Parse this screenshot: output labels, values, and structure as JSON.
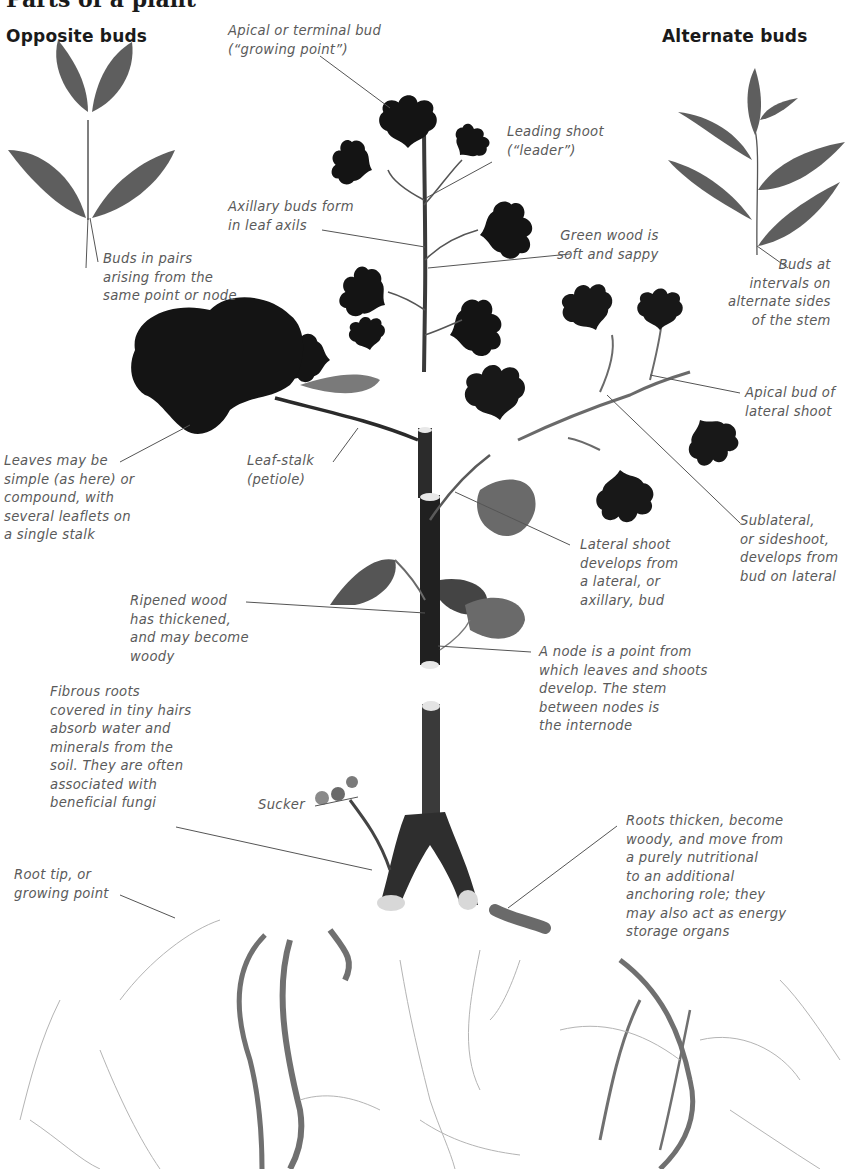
{
  "title": "Parts of a plant",
  "headings": {
    "opposite": "Opposite buds",
    "alternate": "Alternate buds"
  },
  "labels": {
    "apical_bud": "Apical or terminal bud\n(“growing point”)",
    "leading_shoot": "Leading shoot\n(“leader”)",
    "axillary_buds": "Axillary buds form\nin leaf axils",
    "green_wood": "Green wood is\nsoft and sappy",
    "buds_in_pairs": "Buds in pairs\narising from the\nsame point or node",
    "buds_at_intervals": "Buds at\nintervals on\nalternate sides\nof the stem",
    "apical_bud_lateral": "Apical bud of\nlateral shoot",
    "leaves_simple": "Leaves may be\nsimple (as here) or\ncompound, with\nseveral leaflets on\na single stalk",
    "leaf_stalk": "Leaf-stalk\n(petiole)",
    "sublateral": "Sublateral,\nor sideshoot,\ndevelops from\nbud on lateral",
    "lateral_shoot": "Lateral shoot\ndevelops from\na lateral, or\naxillary, bud",
    "ripened_wood": "Ripened wood\nhas thickened,\nand may become\nwoody",
    "node": "A node is a point from\nwhich leaves and shoots\ndevelop. The stem\nbetween nodes is\nthe internode",
    "fibrous_roots": "Fibrous roots\ncovered in tiny hairs\nabsorb water and\nminerals from the\nsoil. They are often\nassociated with\nbeneficial fungi",
    "sucker": "Sucker",
    "root_tip": "Root tip, or\ngrowing point",
    "roots_thicken": "Roots thicken, become\nwoody, and move from\na purely nutritional\nto an additional\nanchoring role; they\nmay also act as energy\nstorage organs"
  },
  "colors": {
    "text": "#5a5a5a",
    "heading": "#1a1a1a",
    "leaf_dark": "#151515",
    "leaf_grey": "#5e5e5e",
    "stem": "#2a2a2a",
    "root": "#6a6a6a",
    "leader_line": "#555555"
  }
}
